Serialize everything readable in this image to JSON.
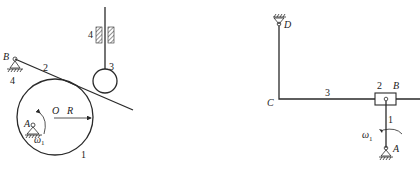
{
  "left_mechanism": {
    "labels": {
      "pivot_B": "B",
      "ground_4": "4",
      "lever_2": "2",
      "roller_3": "3",
      "guide_4": "4",
      "center_O": "O",
      "radius_R": "R",
      "pivot_A": "A",
      "omega": "ω",
      "omega_sub": "1",
      "disc_1": "1"
    }
  },
  "right_mechanism": {
    "labels": {
      "pivot_D": "D",
      "joint_C": "C",
      "link_3": "3",
      "slider_2": "2",
      "joint_B": "B",
      "crank_1": "1",
      "omega": "ω",
      "omega_sub": "1",
      "pivot_A": "A"
    }
  },
  "colors": {
    "stroke": "#2a2a2a",
    "background": "#ffffff"
  }
}
